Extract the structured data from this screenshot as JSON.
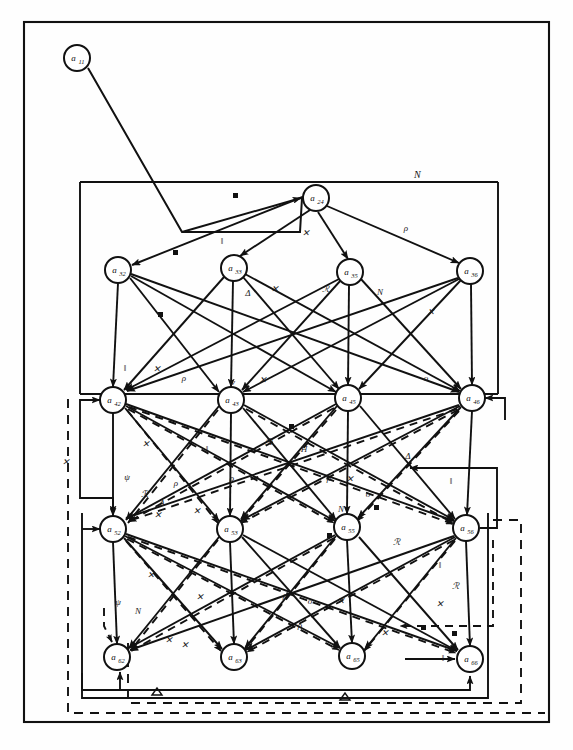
{
  "figure": {
    "background_color": "#fefefe",
    "ink_color": "#111111"
  },
  "frames": [
    {
      "id": "outer-frame",
      "style": "solid",
      "label": ""
    },
    {
      "id": "inner-frame-upper",
      "style": "solid",
      "label": "N"
    },
    {
      "id": "inner-frame-lower",
      "style": "solid",
      "label": ""
    },
    {
      "id": "dashed-frame-outer",
      "style": "dashed",
      "label": ""
    },
    {
      "id": "dashed-frame-inner",
      "style": "dashed",
      "label": ""
    }
  ],
  "frame_labels": {
    "upper_box": "N",
    "lower_loop_left": "Δ",
    "lower_loop_right": "Δ"
  },
  "rows": [
    {
      "row": 1,
      "nodes": [
        {
          "id": "a11",
          "base": "a",
          "sub": "11",
          "x": 77,
          "y": 58
        }
      ]
    },
    {
      "row": 2,
      "nodes": [
        {
          "id": "a24",
          "base": "a",
          "sub": "24",
          "x": 316,
          "y": 198
        }
      ]
    },
    {
      "row": 3,
      "nodes": [
        {
          "id": "a32",
          "base": "a",
          "sub": "32",
          "x": 118,
          "y": 270
        },
        {
          "id": "a33",
          "base": "a",
          "sub": "33",
          "x": 234,
          "y": 268
        },
        {
          "id": "a35",
          "base": "a",
          "sub": "35",
          "x": 350,
          "y": 272
        },
        {
          "id": "a36",
          "base": "a",
          "sub": "36",
          "x": 470,
          "y": 271
        }
      ]
    },
    {
      "row": 4,
      "nodes": [
        {
          "id": "a42",
          "base": "a",
          "sub": "42",
          "x": 113,
          "y": 400
        },
        {
          "id": "a43",
          "base": "a",
          "sub": "43",
          "x": 231,
          "y": 400
        },
        {
          "id": "a45",
          "base": "a",
          "sub": "45",
          "x": 348,
          "y": 398
        },
        {
          "id": "a46",
          "base": "a",
          "sub": "46",
          "x": 472,
          "y": 398
        }
      ]
    },
    {
      "row": 5,
      "nodes": [
        {
          "id": "a52",
          "base": "a",
          "sub": "52",
          "x": 113,
          "y": 529
        },
        {
          "id": "a53",
          "base": "a",
          "sub": "53",
          "x": 230,
          "y": 529
        },
        {
          "id": "a55",
          "base": "a",
          "sub": "55",
          "x": 347,
          "y": 527
        },
        {
          "id": "a56",
          "base": "a",
          "sub": "56",
          "x": 466,
          "y": 528
        }
      ]
    },
    {
      "row": 6,
      "nodes": [
        {
          "id": "a62",
          "base": "a",
          "sub": "62",
          "x": 117,
          "y": 657
        },
        {
          "id": "a63",
          "base": "a",
          "sub": "63",
          "x": 234,
          "y": 657
        },
        {
          "id": "a65",
          "base": "a",
          "sub": "65",
          "x": 352,
          "y": 656
        },
        {
          "id": "a66",
          "base": "a",
          "sub": "66",
          "x": 470,
          "y": 659
        }
      ]
    }
  ],
  "edge_labels": [
    {
      "text": "ρ",
      "x": 406,
      "y": 231
    },
    {
      "text": "‖",
      "x": 222,
      "y": 244
    },
    {
      "text": "✕",
      "x": 306,
      "y": 236
    },
    {
      "text": "Δ",
      "x": 248,
      "y": 296
    },
    {
      "text": "✕",
      "x": 275,
      "y": 292
    },
    {
      "text": "ℛ",
      "x": 325,
      "y": 292
    },
    {
      "text": "Ν",
      "x": 380,
      "y": 295
    },
    {
      "text": "✕",
      "x": 431,
      "y": 315
    },
    {
      "text": "‖",
      "x": 125,
      "y": 371
    },
    {
      "text": "✕",
      "x": 157,
      "y": 372
    },
    {
      "text": "ρ",
      "x": 184,
      "y": 381
    },
    {
      "text": "✕",
      "x": 263,
      "y": 383
    },
    {
      "text": "ν",
      "x": 233,
      "y": 385
    },
    {
      "text": "ο",
      "x": 426,
      "y": 381
    },
    {
      "text": "✕",
      "x": 146,
      "y": 447
    },
    {
      "text": "‖",
      "x": 207,
      "y": 452
    },
    {
      "text": "ℛ",
      "x": 268,
      "y": 445
    },
    {
      "text": "Η",
      "x": 304,
      "y": 452
    },
    {
      "text": "ρ",
      "x": 232,
      "y": 481
    },
    {
      "text": "ρ",
      "x": 329,
      "y": 481
    },
    {
      "text": "Δ",
      "x": 408,
      "y": 459
    },
    {
      "text": "‖",
      "x": 451,
      "y": 484
    },
    {
      "text": "✕",
      "x": 350,
      "y": 482
    },
    {
      "text": "Ν",
      "x": 341,
      "y": 512
    },
    {
      "text": "ο",
      "x": 368,
      "y": 497
    },
    {
      "text": "✕",
      "x": 66,
      "y": 465
    },
    {
      "text": "ψ",
      "x": 127,
      "y": 480
    },
    {
      "text": "ℛ",
      "x": 144,
      "y": 497
    },
    {
      "text": "ρ",
      "x": 176,
      "y": 486
    },
    {
      "text": "Δ",
      "x": 162,
      "y": 506
    },
    {
      "text": "✕",
      "x": 158,
      "y": 518
    },
    {
      "text": "✕",
      "x": 197,
      "y": 514
    },
    {
      "text": "ℛ",
      "x": 396,
      "y": 545
    },
    {
      "text": "‖",
      "x": 440,
      "y": 568
    },
    {
      "text": "✕",
      "x": 151,
      "y": 578
    },
    {
      "text": "ψ",
      "x": 118,
      "y": 605
    },
    {
      "text": "Ν",
      "x": 138,
      "y": 614
    },
    {
      "text": "✕",
      "x": 200,
      "y": 600
    },
    {
      "text": "ρ",
      "x": 285,
      "y": 598
    },
    {
      "text": "ο",
      "x": 310,
      "y": 604
    },
    {
      "text": "✕",
      "x": 341,
      "y": 604
    },
    {
      "text": "ρ",
      "x": 300,
      "y": 628
    },
    {
      "text": "ℛ",
      "x": 455,
      "y": 589
    },
    {
      "text": "✕",
      "x": 440,
      "y": 607
    },
    {
      "text": "✕",
      "x": 169,
      "y": 643
    },
    {
      "text": "✕",
      "x": 185,
      "y": 648
    },
    {
      "text": "✕",
      "x": 385,
      "y": 636
    },
    {
      "text": "‖",
      "x": 443,
      "y": 661
    }
  ],
  "node_radius": 13,
  "legend": {
    "solid_edge": "solid directed arc",
    "dashed_edge": "dashed directed arc",
    "dot_marker": "filled square / dot marker on arc",
    "triangle_marker": "open triangle marker on arc"
  }
}
